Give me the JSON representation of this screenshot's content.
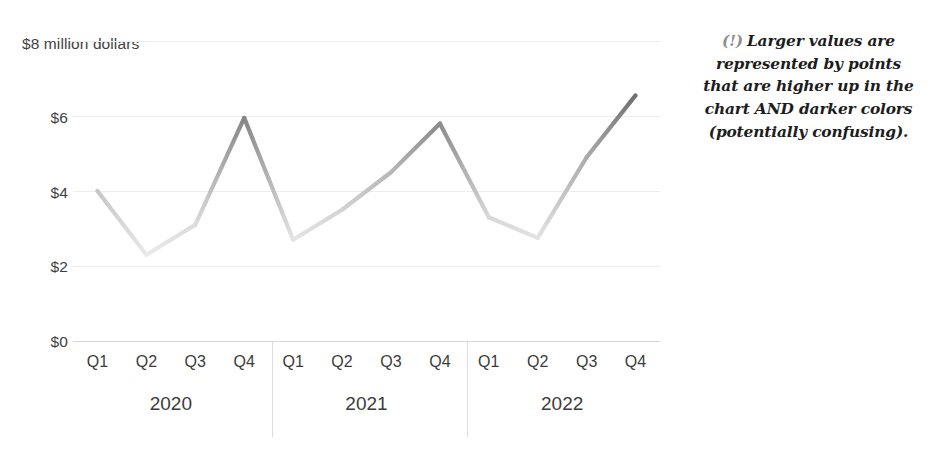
{
  "title_sliver": "",
  "chart_data": {
    "type": "line",
    "title": "",
    "xlabel": "",
    "ylabel": "$8 million dollars",
    "ylim": [
      0,
      8
    ],
    "ytick_values": [
      8,
      6,
      4,
      2,
      0
    ],
    "ytick_labels": [
      "$8 million dollars",
      "$6",
      "$4",
      "$2",
      "$0"
    ],
    "grid": true,
    "legend": "none",
    "x_groups": [
      {
        "label": "2020",
        "categories": [
          "Q1",
          "Q2",
          "Q3",
          "Q4"
        ]
      },
      {
        "label": "2021",
        "categories": [
          "Q1",
          "Q2",
          "Q3",
          "Q4"
        ]
      },
      {
        "label": "2022",
        "categories": [
          "Q1",
          "Q2",
          "Q3",
          "Q4"
        ]
      }
    ],
    "categories": [
      "Q1",
      "Q2",
      "Q3",
      "Q4",
      "Q1",
      "Q2",
      "Q3",
      "Q4",
      "Q1",
      "Q2",
      "Q3",
      "Q4"
    ],
    "values": [
      4.0,
      2.3,
      3.1,
      5.95,
      2.7,
      3.5,
      4.5,
      5.8,
      3.3,
      2.75,
      4.9,
      6.55
    ],
    "encoding_note": "line segment color darkens as value increases",
    "color_low": "#e9e9e9",
    "color_high": "#6f6f6f",
    "gridline_color": "#ededed",
    "axis_color": "#d8d8d8"
  },
  "annotation": {
    "marker": "(!)",
    "lines": [
      "Larger values are",
      "represented by points",
      "that are higher up in the",
      "chart AND darker colors",
      "(potentially confusing)."
    ]
  }
}
